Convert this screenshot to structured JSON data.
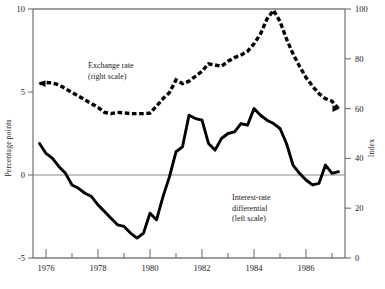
{
  "chart_data": {
    "type": "line",
    "title": "",
    "subtitle": "",
    "xlabel": "",
    "ylabel": "Percentage points",
    "y2label": "Index",
    "grid": false,
    "legend_position": "inside-annotations",
    "xlim": [
      1975.5,
      1987.5
    ],
    "ylim": [
      -5,
      10
    ],
    "y2lim": [
      0,
      100
    ],
    "yticks": [
      -5,
      0,
      5,
      10
    ],
    "yticklabels": [
      "-5",
      "0",
      "5",
      "10"
    ],
    "y2ticks": [
      0,
      20,
      40,
      60,
      80,
      100
    ],
    "y2ticklabels": [
      "0",
      "20",
      "40",
      "60",
      "80",
      "100"
    ],
    "xticks": [
      1976,
      1977,
      1978,
      1979,
      1980,
      1981,
      1982,
      1983,
      1984,
      1985,
      1986,
      1987
    ],
    "xticklabels_major": [
      "1976",
      "1978",
      "1980",
      "1982",
      "1984",
      "1986"
    ],
    "xticks_major": [
      1976,
      1978,
      1980,
      1982,
      1984,
      1986
    ],
    "xticks_minor": [
      1977,
      1979,
      1981,
      1983,
      1985,
      1987
    ],
    "series": [
      {
        "name": "Exchange rate",
        "axis": "right",
        "style": "dashed",
        "annotation": "Exchange rate\n(right scale)",
        "x": [
          1975.75,
          1976.0,
          1976.25,
          1976.5,
          1976.75,
          1977.0,
          1977.25,
          1977.5,
          1977.75,
          1978.0,
          1978.25,
          1978.5,
          1978.75,
          1979.0,
          1979.25,
          1979.5,
          1979.75,
          1980.0,
          1980.25,
          1980.5,
          1980.75,
          1981.0,
          1981.25,
          1981.5,
          1981.75,
          1982.0,
          1982.25,
          1982.5,
          1982.75,
          1983.0,
          1983.25,
          1983.5,
          1983.75,
          1984.0,
          1984.25,
          1984.5,
          1984.75,
          1985.0,
          1985.25,
          1985.5,
          1985.75,
          1986.0,
          1986.25,
          1986.5,
          1986.75,
          1987.0,
          1987.25
        ],
        "values": [
          70.0,
          70.5,
          70.3,
          69.5,
          68.0,
          66.5,
          65.0,
          63.5,
          62.0,
          60.5,
          58.5,
          58.0,
          58.5,
          58.3,
          58.0,
          58.0,
          58.0,
          58.2,
          61.0,
          64.0,
          66.5,
          71.5,
          70.0,
          71.0,
          73.0,
          75.0,
          78.0,
          77.5,
          77.0,
          79.0,
          80.5,
          81.5,
          83.0,
          86.0,
          90.0,
          96.0,
          99.5,
          95.0,
          88.0,
          82.0,
          77.0,
          72.5,
          69.0,
          66.0,
          64.0,
          63.0,
          60.0
        ]
      },
      {
        "name": "Interest-rate differential",
        "axis": "left",
        "style": "solid",
        "annotation": "Interest-rate\ndifferential\n(left scale)",
        "x": [
          1975.75,
          1976.0,
          1976.25,
          1976.5,
          1976.75,
          1977.0,
          1977.25,
          1977.5,
          1977.75,
          1978.0,
          1978.25,
          1978.5,
          1978.75,
          1979.0,
          1979.25,
          1979.5,
          1979.75,
          1980.0,
          1980.25,
          1980.5,
          1980.75,
          1981.0,
          1981.25,
          1981.5,
          1981.75,
          1982.0,
          1982.25,
          1982.5,
          1982.75,
          1983.0,
          1983.25,
          1983.5,
          1983.75,
          1984.0,
          1984.25,
          1984.5,
          1984.75,
          1985.0,
          1985.25,
          1985.5,
          1985.75,
          1986.0,
          1986.25,
          1986.5,
          1986.75,
          1987.0,
          1987.25
        ],
        "values": [
          1.9,
          1.3,
          1.0,
          0.5,
          0.1,
          -0.6,
          -0.8,
          -1.1,
          -1.3,
          -1.8,
          -2.2,
          -2.6,
          -3.0,
          -3.1,
          -3.5,
          -3.8,
          -3.5,
          -2.3,
          -2.7,
          -1.3,
          -0.1,
          1.4,
          1.7,
          3.6,
          3.4,
          3.3,
          1.9,
          1.5,
          2.2,
          2.5,
          2.6,
          3.1,
          3.0,
          4.0,
          3.6,
          3.3,
          3.1,
          2.8,
          1.9,
          0.6,
          0.1,
          -0.3,
          -0.6,
          -0.5,
          0.6,
          0.1,
          0.2
        ]
      }
    ],
    "annotations": [
      {
        "text_lines": [
          "Exchange rate",
          "(right scale)"
        ],
        "x": 88,
        "y": 68
      },
      {
        "text_lines": [
          "Interest-rate",
          "differential",
          "(left scale)"
        ],
        "x": 232,
        "y": 200
      }
    ]
  },
  "axes": {
    "left_title": "Percentage points",
    "right_title": "Index"
  },
  "caption": {
    "text": ""
  }
}
